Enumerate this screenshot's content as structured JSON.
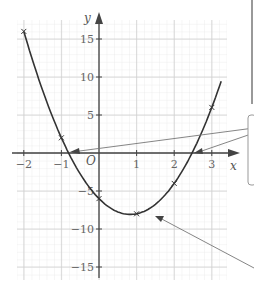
{
  "chart_data": {
    "type": "line",
    "title": "",
    "xlabel": "x",
    "ylabel": "y",
    "origin_label": "O",
    "xlim": [
      -2.1,
      3.3
    ],
    "ylim": [
      -16,
      17
    ],
    "grid": true,
    "x_ticks": [
      -2,
      -1,
      1,
      2,
      3
    ],
    "x_tick_labels": [
      "−2",
      "−1",
      "1",
      "2",
      "3"
    ],
    "y_ticks": [
      15,
      10,
      5,
      -5,
      -10,
      -15
    ],
    "y_tick_labels": [
      "15",
      "10",
      "5",
      "−5",
      "−10",
      "−15"
    ],
    "series": [
      {
        "name": "y = 3x² − 5x − 6",
        "x": [
          -2,
          -1,
          0,
          1,
          2,
          3
        ],
        "y": [
          16,
          2,
          -6,
          -8,
          -4,
          6
        ],
        "markers": "x"
      }
    ],
    "annotations": [
      {
        "type": "arrow",
        "points_to": "root near x = -0.8"
      },
      {
        "type": "arrow",
        "points_to": "root near x = 2.5"
      },
      {
        "type": "arrow",
        "points_to": "minimum near (0.8, -8.1)"
      }
    ]
  }
}
